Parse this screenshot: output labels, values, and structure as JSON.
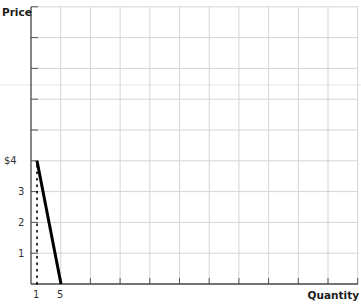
{
  "chart_data": {
    "type": "line",
    "title": "",
    "xlabel": "Quantity",
    "ylabel": "Price",
    "y_tick_labels": [
      "1",
      "2",
      "3",
      "$4"
    ],
    "y_ticks": [
      1,
      2,
      3,
      4
    ],
    "x_tick_labels": [
      "1",
      "5"
    ],
    "x_ticks": [
      1,
      5
    ],
    "grid": true,
    "ylim": [
      0,
      9
    ],
    "xlim": [
      0,
      11
    ],
    "series": [
      {
        "name": "Demand",
        "style": "solid-thick",
        "color": "#000000",
        "points": [
          {
            "q": 1,
            "p": 4
          },
          {
            "q": 5,
            "p": 0
          }
        ]
      },
      {
        "name": "Quantity 1 reference",
        "style": "dotted",
        "color": "#000000",
        "points": [
          {
            "q": 1,
            "p": 0
          },
          {
            "q": 1,
            "p": 4
          }
        ]
      }
    ]
  },
  "labels": {
    "price": "Price",
    "quantity": "Quantity"
  }
}
